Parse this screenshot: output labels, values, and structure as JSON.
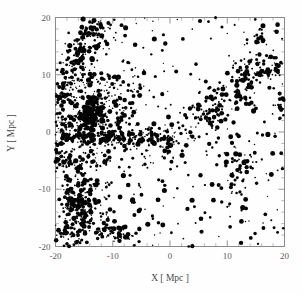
{
  "figure": {
    "background_color": "#fefefe",
    "frame_color": "#8a8a8a",
    "point_color": "#050505"
  },
  "chart_data": {
    "type": "scatter",
    "title": "",
    "subtitle": "",
    "xlabel": "X [ Mpc ]",
    "ylabel": "Y [ Mpc ]",
    "xlim": [
      -20,
      20
    ],
    "ylim": [
      -20,
      20
    ],
    "xticks": [
      -20,
      -10,
      0,
      10,
      20
    ],
    "yticks": [
      -20,
      -10,
      0,
      10,
      20
    ],
    "xtick_labels": [
      "-20",
      "-10",
      "0",
      "10",
      "20"
    ],
    "ytick_labels": [
      "-20",
      "-10",
      "0",
      "10",
      "20"
    ],
    "minor_tick_interval": 2,
    "grid": false,
    "legend": null,
    "annotations": [],
    "marker": "filled-circle",
    "marker_size_range": [
      0.7,
      2.6
    ],
    "n_points": 1180,
    "structures": [
      {
        "name": "main-cluster",
        "center": [
          -14.0,
          3.0
        ],
        "extent": [
          4.0,
          5.0
        ],
        "count": 230
      },
      {
        "name": "horizontal-filament",
        "center": [
          -10.0,
          -1.0
        ],
        "extent": [
          10.0,
          0.9
        ],
        "count": 210
      },
      {
        "name": "diagonal-filament-right",
        "from": [
          0.0,
          -3.0
        ],
        "to": [
          20.0,
          13.0
        ],
        "count": 150
      },
      {
        "name": "lower-left-clumps",
        "center": [
          -16.0,
          -13.0
        ],
        "extent": [
          4.0,
          5.0
        ],
        "count": 150
      },
      {
        "name": "upper-left-stream",
        "from": [
          -20.0,
          5.0
        ],
        "to": [
          -13.0,
          20.0
        ],
        "count": 120
      },
      {
        "name": "field-scatter",
        "count": 320
      }
    ],
    "seed": 20250607
  }
}
